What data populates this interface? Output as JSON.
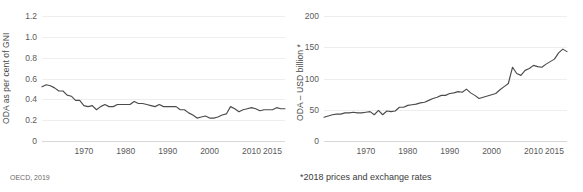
{
  "chart_data": [
    {
      "type": "line",
      "panel": "left",
      "title": "",
      "xlabel": "",
      "ylabel": "ODA as per cent of GNI",
      "xlim": [
        1960,
        2018
      ],
      "ylim": [
        0,
        1.2
      ],
      "grid": true,
      "legend": null,
      "yticks": [
        "0",
        "0.2",
        "0.4",
        "0.6",
        "0.8",
        "1.0",
        "1.2"
      ],
      "ytick_values": [
        0,
        0.2,
        0.4,
        0.6,
        0.8,
        1.0,
        1.2
      ],
      "xticks": [
        "1970",
        "1980",
        "1990",
        "2000",
        "2010",
        "2015"
      ],
      "xtick_values": [
        1970,
        1980,
        1990,
        2000,
        2010,
        2015
      ],
      "x": [
        1960,
        1961,
        1962,
        1963,
        1964,
        1965,
        1966,
        1967,
        1968,
        1969,
        1970,
        1971,
        1972,
        1973,
        1974,
        1975,
        1976,
        1977,
        1978,
        1979,
        1980,
        1981,
        1982,
        1983,
        1984,
        1985,
        1986,
        1987,
        1988,
        1989,
        1990,
        1991,
        1992,
        1993,
        1994,
        1995,
        1996,
        1997,
        1998,
        1999,
        2000,
        2001,
        2002,
        2003,
        2004,
        2005,
        2006,
        2007,
        2008,
        2009,
        2010,
        2011,
        2012,
        2013,
        2014,
        2015,
        2016,
        2017,
        2018
      ],
      "values": [
        0.52,
        0.54,
        0.53,
        0.51,
        0.48,
        0.48,
        0.44,
        0.43,
        0.39,
        0.39,
        0.34,
        0.33,
        0.34,
        0.3,
        0.33,
        0.35,
        0.33,
        0.33,
        0.35,
        0.35,
        0.35,
        0.35,
        0.38,
        0.36,
        0.36,
        0.35,
        0.34,
        0.33,
        0.35,
        0.33,
        0.33,
        0.33,
        0.33,
        0.3,
        0.3,
        0.27,
        0.25,
        0.22,
        0.23,
        0.24,
        0.22,
        0.22,
        0.23,
        0.25,
        0.26,
        0.33,
        0.31,
        0.28,
        0.3,
        0.31,
        0.32,
        0.31,
        0.29,
        0.3,
        0.3,
        0.3,
        0.32,
        0.31,
        0.31
      ],
      "annotation": "OECD, 2019"
    },
    {
      "type": "line",
      "panel": "right",
      "title": "",
      "xlabel": "",
      "ylabel": "ODA – USD billion *",
      "xlim": [
        1960,
        2018
      ],
      "ylim": [
        0,
        200
      ],
      "grid": true,
      "legend": null,
      "yticks": [
        "0",
        "50",
        "100",
        "150",
        "200"
      ],
      "ytick_values": [
        0,
        50,
        100,
        150,
        200
      ],
      "xticks": [
        "1970",
        "1980",
        "1990",
        "2000",
        "2010",
        "2015"
      ],
      "xtick_values": [
        1970,
        1980,
        1990,
        2000,
        2010,
        2015
      ],
      "x": [
        1960,
        1961,
        1962,
        1963,
        1964,
        1965,
        1966,
        1967,
        1968,
        1969,
        1970,
        1971,
        1972,
        1973,
        1974,
        1975,
        1976,
        1977,
        1978,
        1979,
        1980,
        1981,
        1982,
        1983,
        1984,
        1985,
        1986,
        1987,
        1988,
        1989,
        1990,
        1991,
        1992,
        1993,
        1994,
        1995,
        1996,
        1997,
        1998,
        1999,
        2000,
        2001,
        2002,
        2003,
        2004,
        2005,
        2006,
        2007,
        2008,
        2009,
        2010,
        2011,
        2012,
        2013,
        2014,
        2015,
        2016,
        2017,
        2018
      ],
      "values": [
        38,
        40,
        42,
        43,
        43,
        45,
        45,
        46,
        45,
        45,
        46,
        47,
        42,
        49,
        42,
        48,
        47,
        48,
        54,
        54,
        57,
        58,
        59,
        61,
        62,
        65,
        68,
        70,
        73,
        73,
        76,
        77,
        79,
        78,
        83,
        77,
        73,
        68,
        70,
        72,
        74,
        76,
        82,
        87,
        92,
        118,
        108,
        105,
        113,
        116,
        121,
        119,
        118,
        123,
        127,
        131,
        141,
        147,
        143
      ],
      "annotation": "*2018 prices and exchange rates"
    }
  ],
  "left_panel": {
    "ylabel": "ODA as per cent of GNI",
    "footnote": "OECD, 2019"
  },
  "right_panel": {
    "ylabel": "ODA – USD billion *",
    "footnote": "*2018 prices and exchange rates"
  },
  "colors": {
    "line": "#4b4b4b",
    "grid": "#eeeeee",
    "axis": "#d8d8d8",
    "tick_text": "#5a5a5a",
    "background": "#ffffff"
  }
}
